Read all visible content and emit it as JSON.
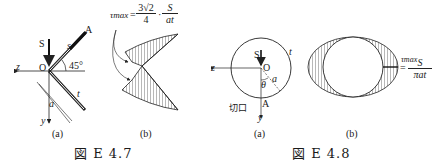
{
  "figures": [
    {
      "caption": "図 E 4.7",
      "panels": [
        {
          "label": "(a)",
          "labels": {
            "S": "S",
            "A": "A",
            "s": "s",
            "O": "O",
            "angle": "45°",
            "z": "z",
            "y": "y",
            "a": "a",
            "t": "t"
          }
        },
        {
          "label": "(b)",
          "formula": {
            "lhs": "τmax",
            "eq": "=",
            "num1": "3√2",
            "den1": "4",
            "dot": "·",
            "num2": "S",
            "den2": "at"
          }
        }
      ]
    },
    {
      "caption": "図 E 4.8",
      "panels": [
        {
          "label": "(a)",
          "labels": {
            "S": "S",
            "O": "O",
            "z": "z",
            "y": "y",
            "a": "a",
            "t": "t",
            "theta": "θ",
            "A": "A",
            "cut": "切口"
          }
        },
        {
          "label": "(b)",
          "formula": {
            "lhs": "τmax",
            "eq": "=",
            "num": "S",
            "den": "πat"
          }
        }
      ]
    }
  ]
}
